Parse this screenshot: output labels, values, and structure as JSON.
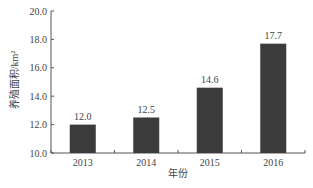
{
  "chart_data": {
    "type": "bar",
    "title": "",
    "xlabel": "年份",
    "ylabel": "养殖面积/km²",
    "categories": [
      "2013",
      "2014",
      "2015",
      "2016"
    ],
    "values": [
      12.0,
      12.5,
      14.6,
      17.7
    ],
    "value_labels": [
      "12.0",
      "12.5",
      "14.6",
      "17.7"
    ],
    "ylim": [
      10.0,
      20.0
    ],
    "yticks": [
      "10.0",
      "12.0",
      "14.0",
      "16.0",
      "18.0",
      "20.0"
    ],
    "grid": false,
    "legend": null,
    "bar_color": "#3b3b3b"
  }
}
